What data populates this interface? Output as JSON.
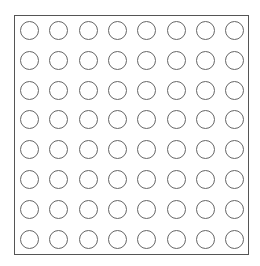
{
  "board": {
    "rows": 8,
    "cols": 8,
    "origin_x": 20,
    "origin_y": 21,
    "pitch_x": 29.3,
    "pitch_y": 29.8,
    "cell_state": "empty",
    "border_color": "#555555",
    "circle_color": "#666666"
  }
}
